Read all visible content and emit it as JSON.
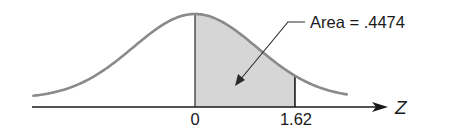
{
  "figure": {
    "type": "standard-normal-curve",
    "annotation": "Area = .4474",
    "axis_label": "Z",
    "ticks": [
      {
        "label": "0",
        "z": 0
      },
      {
        "label": "1.62",
        "z": 1.62
      }
    ],
    "shaded_region": {
      "from_z": 0,
      "to_z": 1.62,
      "area": 0.4474
    },
    "colors": {
      "curve": "#8a8a8a",
      "shade": "#d6d6d6",
      "axis": "#1a1a1a",
      "text": "#1a1a1a"
    }
  }
}
